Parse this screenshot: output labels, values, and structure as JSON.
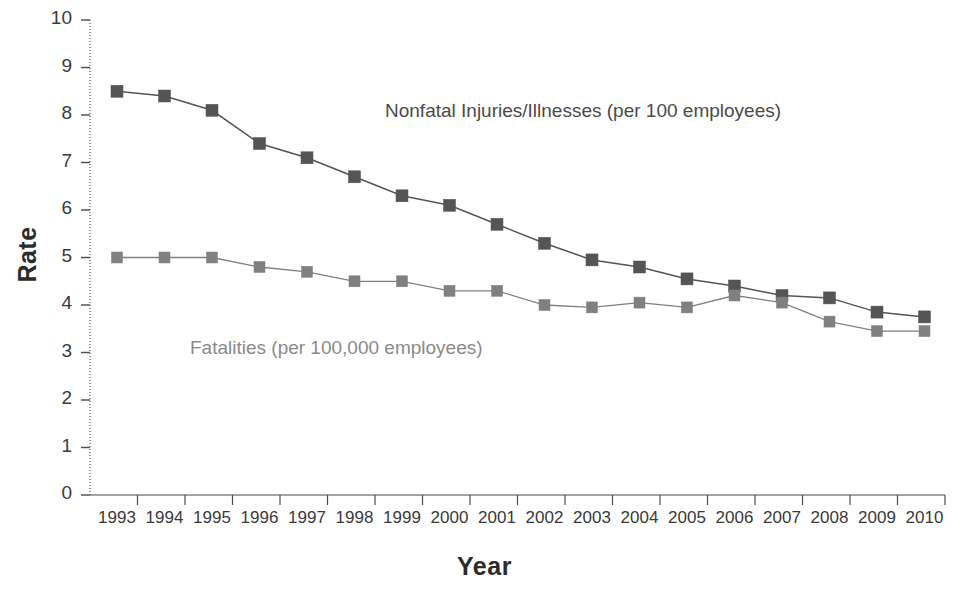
{
  "chart_data": {
    "type": "line",
    "title": "",
    "xlabel": "Year",
    "ylabel": "Rate",
    "xlim": [
      1993,
      2010
    ],
    "ylim": [
      0,
      10
    ],
    "grid": false,
    "legend_position": "inline-annotations",
    "x": [
      1993,
      1994,
      1995,
      1996,
      1997,
      1998,
      1999,
      2000,
      2001,
      2002,
      2003,
      2004,
      2005,
      2006,
      2007,
      2008,
      2009,
      2010
    ],
    "categories": [
      "1993",
      "1994",
      "1995",
      "1996",
      "1997",
      "1998",
      "1999",
      "2000",
      "2001",
      "2002",
      "2003",
      "2004",
      "2005",
      "2006",
      "2007",
      "2008",
      "2009",
      "2010"
    ],
    "yticks": [
      0,
      1,
      2,
      3,
      4,
      5,
      6,
      7,
      8,
      9,
      10
    ],
    "ytick_labels": [
      "0",
      "1",
      "2",
      "3",
      "4",
      "5",
      "6",
      "7",
      "8",
      "9",
      "10"
    ],
    "series": [
      {
        "name": "Nonfatal Injuries/Illnesses (per 100 employees)",
        "color": "#555555",
        "marker": "square",
        "values": [
          8.5,
          8.4,
          8.1,
          7.4,
          7.1,
          6.7,
          6.3,
          6.1,
          5.7,
          5.3,
          4.95,
          4.8,
          4.55,
          4.4,
          4.2,
          4.15,
          3.85,
          3.75
        ]
      },
      {
        "name": "Fatalities (per 100,000 employees)",
        "color": "#808080",
        "marker": "square",
        "values": [
          5.0,
          5.0,
          5.0,
          4.8,
          4.7,
          4.5,
          4.5,
          4.3,
          4.3,
          4.0,
          3.95,
          4.05,
          3.95,
          4.2,
          4.05,
          3.65,
          3.45,
          3.45
        ]
      }
    ],
    "annotations": [
      {
        "id": "nonfatal",
        "text": "Nonfatal Injuries/Illnesses (per 100 employees)",
        "x_px": 385,
        "y_px": 100
      },
      {
        "id": "fatalities",
        "text": "Fatalities (per 100,000 employees)",
        "x_px": 190,
        "y_px": 337
      }
    ]
  },
  "axes": {
    "y_title": "Rate",
    "x_title": "Year"
  },
  "colors": {
    "nonfatal": "#555555",
    "fatalities": "#808080",
    "axis": "#4d4d4d",
    "background": "#ffffff"
  }
}
